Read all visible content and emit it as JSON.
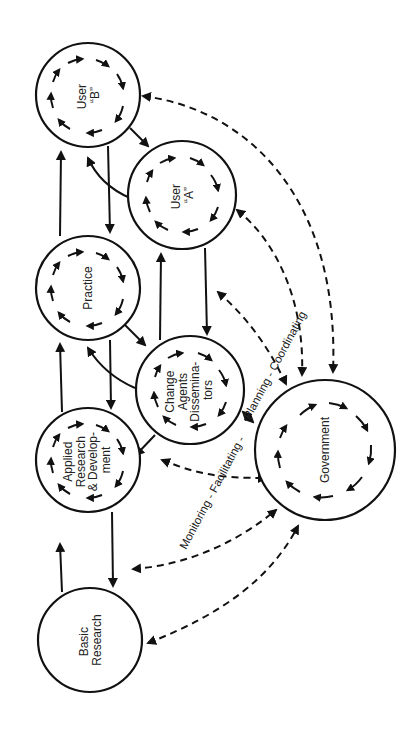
{
  "diagram": {
    "nodes": [
      {
        "id": "user_b",
        "lines": [
          "User",
          "“B”"
        ]
      },
      {
        "id": "user_a",
        "lines": [
          "User",
          "“A”"
        ]
      },
      {
        "id": "practice",
        "lines": [
          "Practice"
        ]
      },
      {
        "id": "change_agents",
        "lines": [
          "Change",
          "Agents",
          "Dissemina-",
          "tors"
        ]
      },
      {
        "id": "applied_research",
        "lines": [
          "Applied",
          "Research",
          "& Develop-",
          "ment"
        ]
      },
      {
        "id": "basic_research",
        "lines": [
          "Basic",
          "Research"
        ]
      },
      {
        "id": "government",
        "lines": [
          "Government"
        ]
      }
    ],
    "edge_labels": {
      "monitoring": "Monitoring - Facilitating -",
      "planning": "Planning - Coordinating"
    },
    "colors": {
      "line": "#111111",
      "background": "#ffffff"
    }
  }
}
